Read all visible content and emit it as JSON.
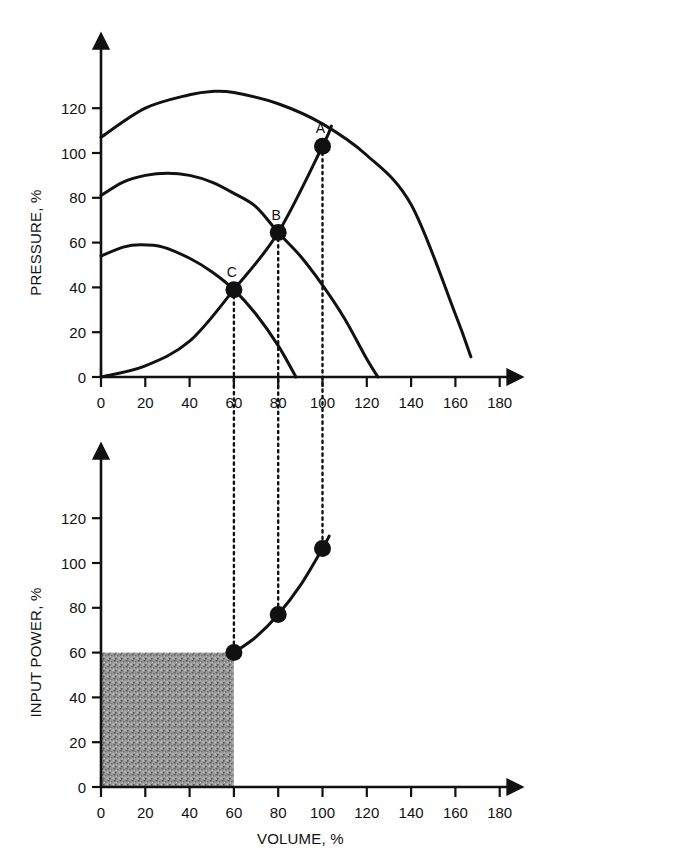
{
  "chart_data": [
    {
      "id": "pressure-chart",
      "type": "line",
      "title": "",
      "xlabel": "",
      "ylabel": "PRESSURE, %",
      "xlim": [
        0,
        190
      ],
      "ylim": [
        0,
        134
      ],
      "xticks": [
        0,
        20,
        40,
        60,
        80,
        100,
        120,
        140,
        160,
        180
      ],
      "yticks": [
        0,
        20,
        40,
        60,
        80,
        100,
        120
      ],
      "grid": false,
      "legend": "none",
      "series": [
        {
          "name": "pump-curve-high-speed",
          "points": [
            [
              0,
              107
            ],
            [
              20,
              120
            ],
            [
              40,
              126
            ],
            [
              50,
              127.5
            ],
            [
              60,
              127
            ],
            [
              80,
              122
            ],
            [
              100,
              113
            ],
            [
              120,
              99
            ],
            [
              140,
              77
            ],
            [
              160,
              28
            ],
            [
              167,
              9
            ]
          ]
        },
        {
          "name": "pump-curve-mid-speed",
          "points": [
            [
              0,
              81
            ],
            [
              10,
              87
            ],
            [
              20,
              90
            ],
            [
              30,
              91
            ],
            [
              40,
              90
            ],
            [
              50,
              87
            ],
            [
              60,
              82
            ],
            [
              70,
              76
            ],
            [
              80,
              64.5
            ],
            [
              90,
              54
            ],
            [
              100,
              41
            ],
            [
              110,
              26
            ],
            [
              120,
              8
            ],
            [
              125,
              0
            ]
          ]
        },
        {
          "name": "pump-curve-low-speed",
          "points": [
            [
              0,
              54
            ],
            [
              10,
              58
            ],
            [
              18,
              59
            ],
            [
              28,
              58
            ],
            [
              40,
              53
            ],
            [
              50,
              47
            ],
            [
              60,
              39
            ],
            [
              70,
              28
            ],
            [
              80,
              14
            ],
            [
              88,
              0
            ]
          ]
        },
        {
          "name": "system-resistance-curve",
          "points": [
            [
              0,
              0
            ],
            [
              20,
              5
            ],
            [
              40,
              16
            ],
            [
              60,
              39
            ],
            [
              80,
              64.5
            ],
            [
              100,
              103
            ],
            [
              104,
              112
            ]
          ]
        }
      ],
      "operating_points": [
        {
          "label": "A",
          "x": 100,
          "y": 103
        },
        {
          "label": "B",
          "x": 80,
          "y": 64.5
        },
        {
          "label": "C",
          "x": 60,
          "y": 39
        }
      ]
    },
    {
      "id": "input-power-chart",
      "type": "line",
      "title": "",
      "xlabel": "VOLUME, %",
      "ylabel": "INPUT POWER, %",
      "xlim": [
        0,
        190
      ],
      "ylim": [
        0,
        134
      ],
      "xticks": [
        0,
        20,
        40,
        60,
        80,
        100,
        120,
        140,
        160,
        180
      ],
      "yticks": [
        0,
        20,
        40,
        60,
        80,
        100,
        120
      ],
      "grid": false,
      "legend": "none",
      "series": [
        {
          "name": "input-power-curve",
          "points": [
            [
              60,
              60
            ],
            [
              70,
              67
            ],
            [
              80,
              77
            ],
            [
              90,
              90
            ],
            [
              100,
              106.5
            ],
            [
              103,
              112
            ]
          ]
        }
      ],
      "operating_points": [
        {
          "label": "",
          "x": 60,
          "y": 60
        },
        {
          "label": "",
          "x": 80,
          "y": 77
        },
        {
          "label": "",
          "x": 100,
          "y": 106.5
        }
      ],
      "shaded_region": {
        "name": "energy-saving-area",
        "x0": 0,
        "x1": 60,
        "y0": 0,
        "y1": 60,
        "fill": "#8c8c8c"
      }
    }
  ],
  "projection_lines": [
    {
      "name": "projection-at-60",
      "x": 60
    },
    {
      "name": "projection-at-80",
      "x": 80
    },
    {
      "name": "projection-at-100",
      "x": 100
    }
  ],
  "colors": {
    "ink": "#111111",
    "background": "#ffffff",
    "shade": "#8c8c8c"
  }
}
